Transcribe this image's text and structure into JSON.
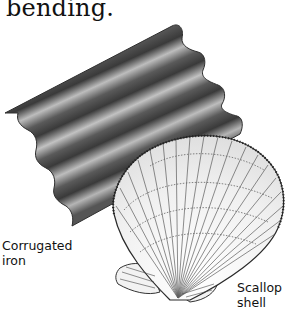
{
  "caption": {
    "text": "bending."
  },
  "labels": {
    "iron_line1": "Corrugated",
    "iron_line2": "iron",
    "shell_line1": "Scallop",
    "shell_line2": "shell"
  },
  "illustrations": [
    {
      "name": "corrugated-iron-sheet",
      "colors": {
        "dark": "#3c3c3c",
        "light": "#b8b8b8"
      }
    },
    {
      "name": "scallop-shell",
      "colors": {
        "line": "#3a3a3a",
        "fill": "#f4f4f4"
      }
    }
  ]
}
